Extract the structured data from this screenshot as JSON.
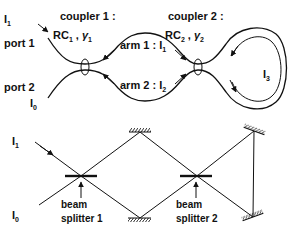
{
  "top_diagram": {
    "title": "fiber ring interferometer",
    "port1_label": "port 1",
    "port2_label": "port 2",
    "input_top": {
      "base": "I",
      "sub": "1"
    },
    "input_bottom": {
      "base": "I",
      "sub": "0"
    },
    "coupler1": {
      "title": "coupler 1 :",
      "param_rc": "RC",
      "param_rc_sub": "1",
      "param_gamma": "γ",
      "param_gamma_sub": "1"
    },
    "coupler2": {
      "title": "coupler 2 :",
      "param_rc": "RC",
      "param_rc_sub": "2",
      "param_gamma": "γ",
      "param_gamma_sub": "2"
    },
    "arm1": {
      "label": "arm 1 : I",
      "sub": "1"
    },
    "arm2": {
      "label": "arm 2 : I",
      "sub": "2"
    },
    "loop": {
      "base": "I",
      "sub": "3"
    }
  },
  "bottom_diagram": {
    "title": "free-space equivalent",
    "input_top": {
      "base": "I",
      "sub": "1"
    },
    "input_bottom": {
      "base": "I",
      "sub": "0"
    },
    "beam_splitter1": {
      "line1": "beam",
      "line2": "splitter 1"
    },
    "beam_splitter2": {
      "line1": "beam",
      "line2": "splitter 2"
    },
    "mirrors": [
      "top-middle",
      "bottom-middle",
      "top-right",
      "bottom-right"
    ]
  }
}
